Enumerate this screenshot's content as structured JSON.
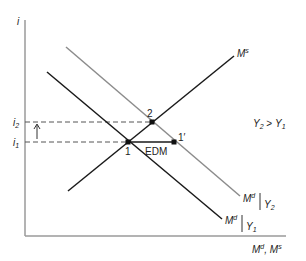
{
  "diagram": {
    "axes": {
      "y_label": "i",
      "x_label_main": "M",
      "x_label_sup1": "d",
      "x_label_sep": ", ",
      "x_label_main2": "M",
      "x_label_sup2": "s"
    },
    "levels": {
      "i2_main": "i",
      "i2_sub": "2",
      "i1_main": "i",
      "i1_sub": "1"
    },
    "curves": {
      "ms": {
        "main": "M",
        "sup": "s"
      },
      "md_y2": {
        "main": "M",
        "sup": "d",
        "cond_main": "Y",
        "cond_sub": "2"
      },
      "md_y1": {
        "main": "M",
        "sup": "d",
        "cond_main": "Y",
        "cond_sub": "1"
      }
    },
    "points": {
      "p1": "1",
      "p2": "2",
      "p1prime": "1′"
    },
    "annotations": {
      "edm": "EDM",
      "cond_y2": "Y",
      "cond_y2_sub": "2",
      "cond_gt": " > ",
      "cond_y1": "Y",
      "cond_y1_sub": "1"
    },
    "colors": {
      "axis": "#9a9a9a",
      "md_y1": "#1a1a1a",
      "md_y2": "#8c8c8c",
      "ms": "#1a1a1a",
      "dash": "#555555"
    }
  }
}
